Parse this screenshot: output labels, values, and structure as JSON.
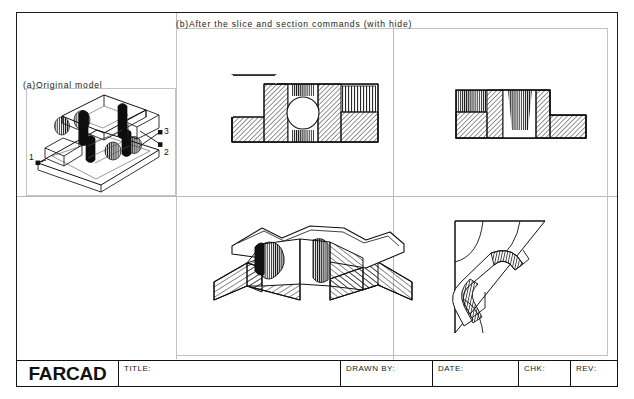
{
  "sheet": {
    "background": "#ffffff",
    "line_color": "#1c1c1c",
    "thin_line_color": "#c3c3c3"
  },
  "captions": {
    "original_model": "(a)Original model",
    "after_slice": "(b)After the slice and section commands (with hide)"
  },
  "callouts": [
    {
      "label": "1"
    },
    {
      "label": "2"
    },
    {
      "label": "3"
    }
  ],
  "views": {
    "iso_original": {
      "name": "isometric-wireframe-model"
    },
    "section_top_middle": {
      "name": "front-section-with-round-hole"
    },
    "section_top_right": {
      "name": "side-section-view"
    },
    "iso_sliced": {
      "name": "sliced-solid-isometric"
    },
    "corner_section": {
      "name": "corner-section-detail"
    }
  },
  "titleblock": {
    "logo": "FARCAD",
    "fields": [
      {
        "label": "TITLE:",
        "value": ""
      },
      {
        "label": "DRAWN BY:",
        "value": ""
      },
      {
        "label": "DATE:",
        "value": ""
      },
      {
        "label": "CHK:",
        "value": ""
      },
      {
        "label": "REV:",
        "value": ""
      }
    ]
  }
}
